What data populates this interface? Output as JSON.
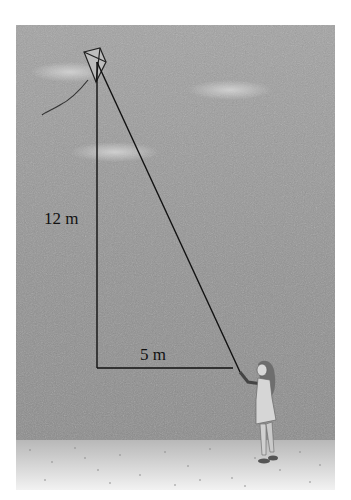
{
  "figure": {
    "labels": {
      "height": "12 m",
      "base": "5 m"
    },
    "colors": {
      "sky": "#9a9a9a",
      "sky_dark": "#8a8a8a",
      "cloud": "#c8c8c8",
      "ground": "#e2e2e2",
      "line": "#111111"
    }
  }
}
